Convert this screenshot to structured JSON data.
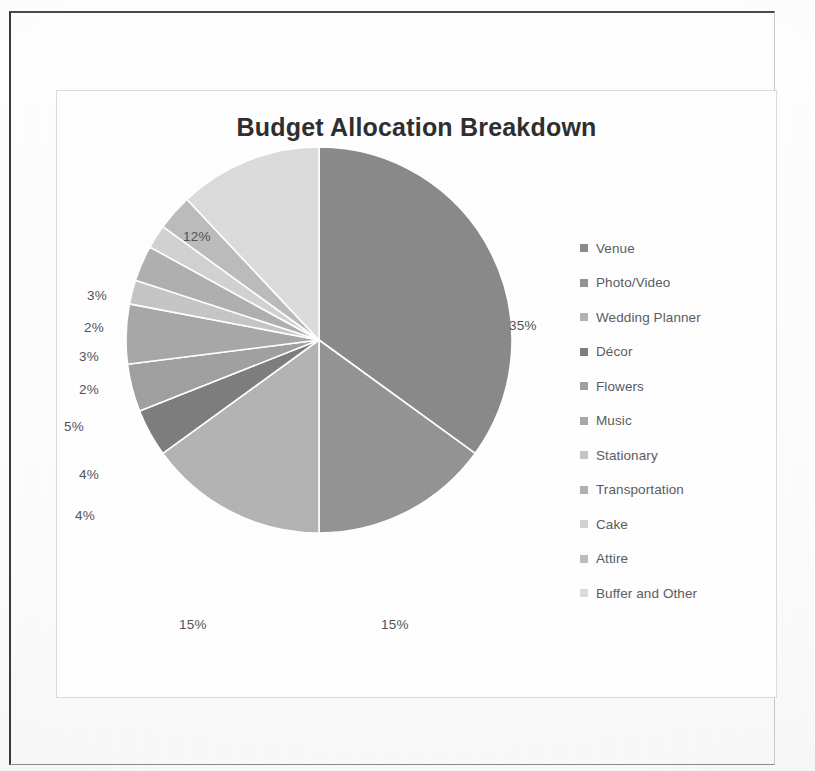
{
  "chart_data": {
    "type": "pie",
    "title": "Budget Allocation Breakdown",
    "subtitle": "",
    "xlabel": "",
    "ylabel": "",
    "legend_position": "right",
    "grid": false,
    "value_unit": "%",
    "total": 100,
    "categories": [
      "Venue",
      "Photo/Video",
      "Wedding Planner",
      "Décor",
      "Flowers",
      "Music",
      "Stationary",
      "Transportation",
      "Cake",
      "Attire",
      "Buffer and Other"
    ],
    "values": [
      35,
      15,
      15,
      4,
      4,
      5,
      2,
      3,
      2,
      3,
      12
    ],
    "labels": [
      "35%",
      "15%",
      "15%",
      "4%",
      "4%",
      "5%",
      "2%",
      "3%",
      "2%",
      "3%",
      "12%"
    ],
    "colors": [
      "#8a8a8a",
      "#949494",
      "#b4b4b4",
      "#7e7e7e",
      "#a0a0a0",
      "#a8a8a8",
      "#c6c6c6",
      "#b0b0b0",
      "#d2d2d2",
      "#bcbcbc",
      "#dcdcdc"
    ],
    "slices": [
      {
        "name": "Venue",
        "value": 35,
        "label": "35%",
        "color": "#8a8a8a"
      },
      {
        "name": "Photo/Video",
        "value": 15,
        "label": "15%",
        "color": "#949494"
      },
      {
        "name": "Wedding Planner",
        "value": 15,
        "label": "15%",
        "color": "#b4b4b4"
      },
      {
        "name": "Décor",
        "value": 4,
        "label": "4%",
        "color": "#7e7e7e"
      },
      {
        "name": "Flowers",
        "value": 4,
        "label": "4%",
        "color": "#a0a0a0"
      },
      {
        "name": "Music",
        "value": 5,
        "label": "5%",
        "color": "#a8a8a8"
      },
      {
        "name": "Stationary",
        "value": 2,
        "label": "2%",
        "color": "#c6c6c6"
      },
      {
        "name": "Transportation",
        "value": 3,
        "label": "3%",
        "color": "#b0b0b0"
      },
      {
        "name": "Cake",
        "value": 2,
        "label": "2%",
        "color": "#d2d2d2"
      },
      {
        "name": "Attire",
        "value": 3,
        "label": "3%",
        "color": "#bcbcbc"
      },
      {
        "name": "Buffer and Other",
        "value": 12,
        "label": "12%",
        "color": "#dcdcdc"
      }
    ]
  },
  "title": {
    "text": "Budget Allocation Breakdown"
  },
  "legend": {
    "items": [
      {
        "label": "Venue",
        "color": "#8a8a8a"
      },
      {
        "label": "Photo/Video",
        "color": "#949494"
      },
      {
        "label": "Wedding Planner",
        "color": "#b4b4b4"
      },
      {
        "label": "Décor",
        "color": "#7e7e7e"
      },
      {
        "label": "Flowers",
        "color": "#a0a0a0"
      },
      {
        "label": "Music",
        "color": "#a8a8a8"
      },
      {
        "label": "Stationary",
        "color": "#c6c6c6"
      },
      {
        "label": "Transportation",
        "color": "#b0b0b0"
      },
      {
        "label": "Cake",
        "color": "#d2d2d2"
      },
      {
        "label": "Attire",
        "color": "#bcbcbc"
      },
      {
        "label": "Buffer and Other",
        "color": "#dcdcdc"
      }
    ]
  },
  "data_labels": [
    {
      "text": "35%",
      "left": 452,
      "top": 227
    },
    {
      "text": "15%",
      "left": 324,
      "top": 526
    },
    {
      "text": "15%",
      "left": 122,
      "top": 526
    },
    {
      "text": "4%",
      "left": 18,
      "top": 417
    },
    {
      "text": "4%",
      "left": 22,
      "top": 376
    },
    {
      "text": "5%",
      "left": 7,
      "top": 328
    },
    {
      "text": "2%",
      "left": 22,
      "top": 291
    },
    {
      "text": "3%",
      "left": 22,
      "top": 258
    },
    {
      "text": "2%",
      "left": 27,
      "top": 229
    },
    {
      "text": "3%",
      "left": 30,
      "top": 197
    },
    {
      "text": "12%",
      "left": 126,
      "top": 138
    }
  ],
  "appearance": {
    "pie_center_x": 196,
    "pie_center_y": 196,
    "pie_radius": 193,
    "slice_gap_color": "#ffffff",
    "start_angle_deg": -90,
    "background": "#ffffff",
    "title_color": "#2f2f31",
    "label_color": "#53535a",
    "legend_text_color": "#5c5c63",
    "frame_color": "#3a3a3c",
    "chart_border_color": "#dcdcde"
  }
}
